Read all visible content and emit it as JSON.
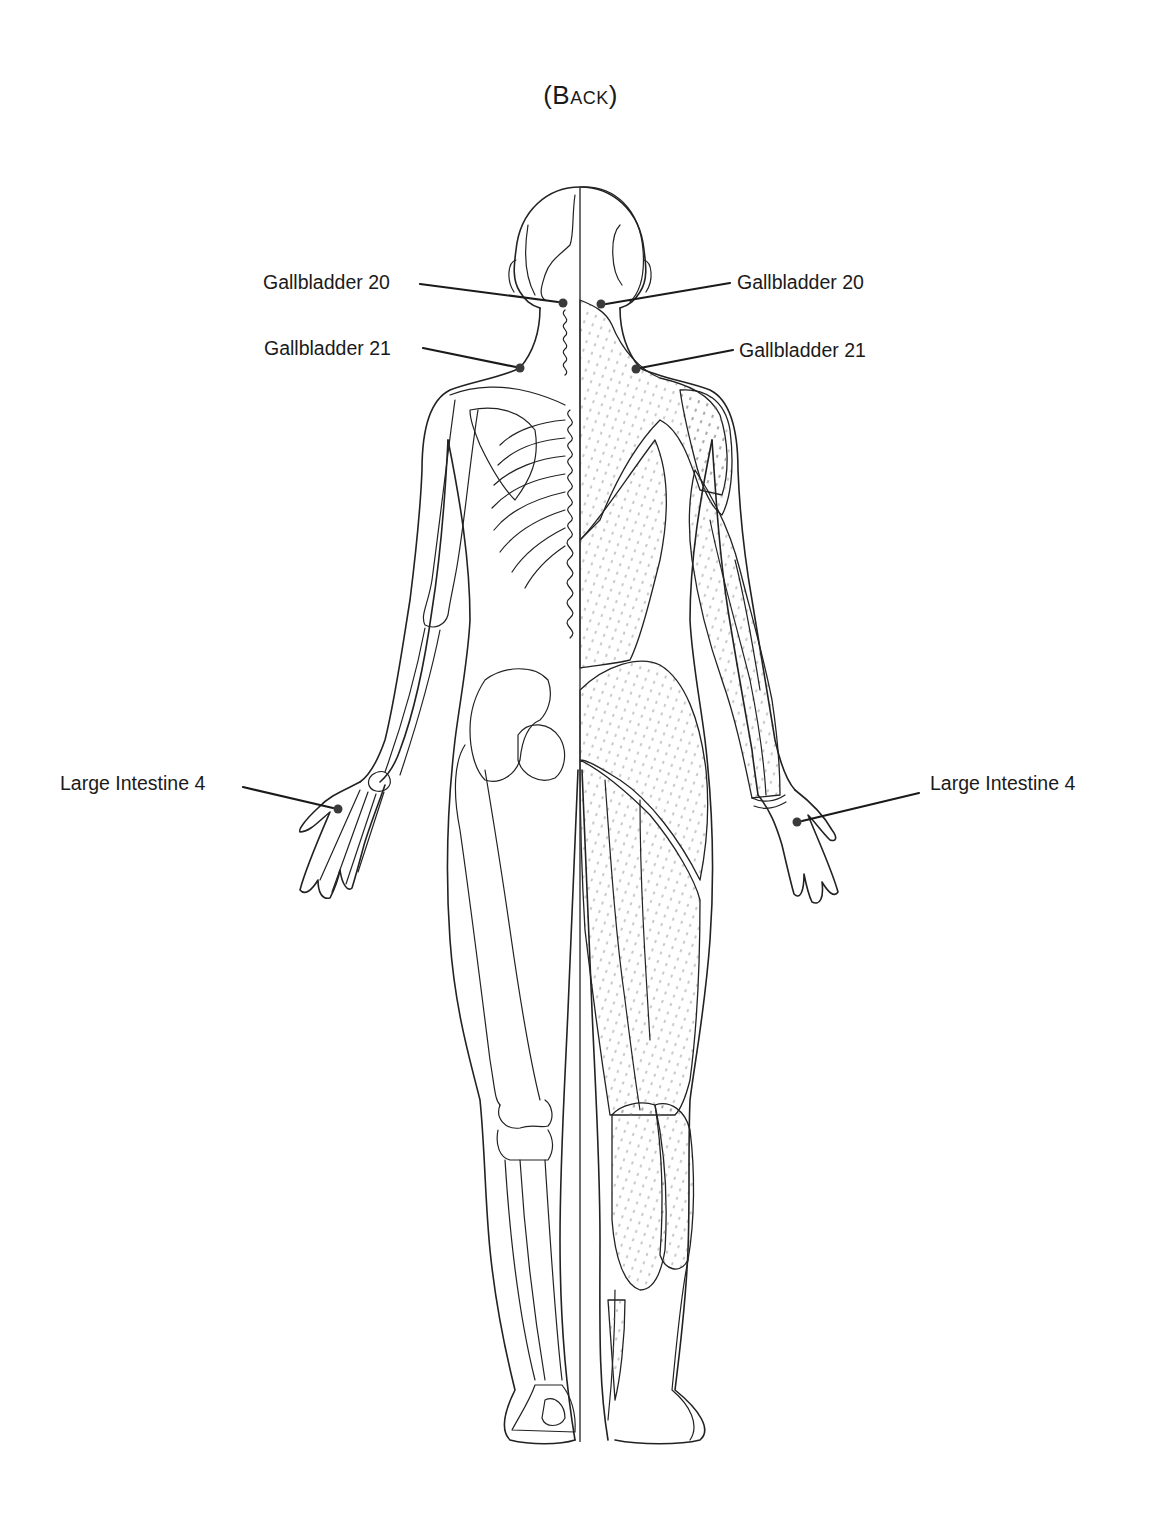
{
  "diagram": {
    "title": "(Back)",
    "view": "posterior",
    "left_half": "skeleton",
    "right_half": "muscles"
  },
  "labels": [
    {
      "id": "gb20-left",
      "text": "Gallbladder 20",
      "side": "left",
      "x": 263,
      "y": 273,
      "point": {
        "x": 563,
        "y": 303
      }
    },
    {
      "id": "gb21-left",
      "text": "Gallbladder 21",
      "side": "left",
      "x": 264,
      "y": 339,
      "point": {
        "x": 520,
        "y": 368
      }
    },
    {
      "id": "gb20-right",
      "text": "Gallbladder 20",
      "side": "right",
      "x": 737,
      "y": 273,
      "point": {
        "x": 601,
        "y": 304
      }
    },
    {
      "id": "gb21-right",
      "text": "Gallbladder 21",
      "side": "right",
      "x": 739,
      "y": 341,
      "point": {
        "x": 636,
        "y": 369
      }
    },
    {
      "id": "li4-left",
      "text": "Large Intestine 4",
      "side": "left",
      "x": 60,
      "y": 774,
      "point": {
        "x": 338,
        "y": 809
      }
    },
    {
      "id": "li4-right",
      "text": "Large Intestine 4",
      "side": "right",
      "x": 930,
      "y": 774,
      "point": {
        "x": 797,
        "y": 822
      }
    }
  ],
  "colors": {
    "ink": "#1a1a1a",
    "point": "#3a3a3a",
    "background": "#ffffff"
  }
}
